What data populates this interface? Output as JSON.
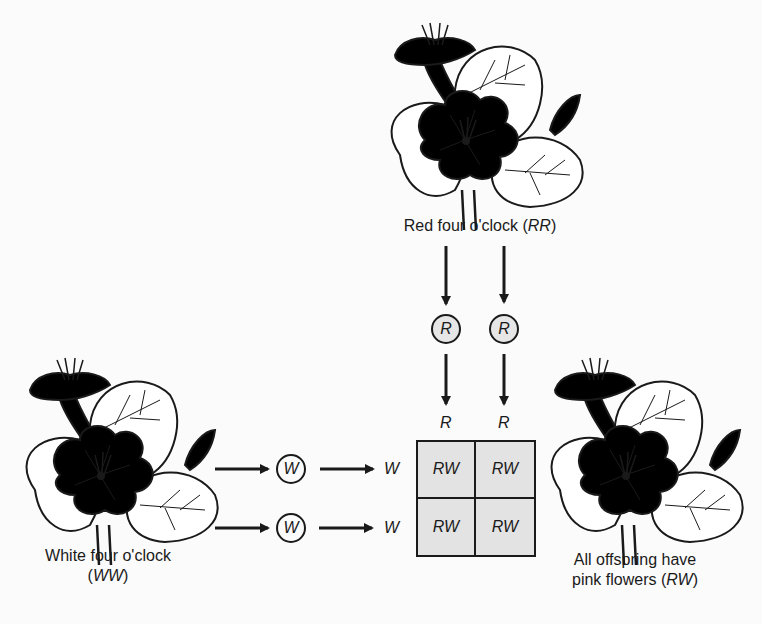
{
  "diagram": {
    "type": "punnett-square-incomplete-dominance",
    "colors": {
      "line": "#1a1a1a",
      "red_fill": "#9a9a9a",
      "pink_fill": "#b8b8b8",
      "grid_fill": "#e3e3e3",
      "background": "#fbfbfb"
    },
    "parents": {
      "red": {
        "label_prefix": "Red four o'clock (",
        "genotype": "RR",
        "label_suffix": ")"
      },
      "white": {
        "label_line1": "White four o'clock",
        "label_prefix": "(",
        "genotype": "WW",
        "label_suffix": ")"
      }
    },
    "offspring": {
      "label_line1": "All offspring have",
      "label_prefix": "pink flowers (",
      "genotype": "RW",
      "label_suffix": ")"
    },
    "gametes": {
      "red": [
        "R",
        "R"
      ],
      "white": [
        "W",
        "W"
      ]
    },
    "punnett": {
      "column_headers": [
        "R",
        "R"
      ],
      "row_headers": [
        "W",
        "W"
      ],
      "cells": [
        [
          "RW",
          "RW"
        ],
        [
          "RW",
          "RW"
        ]
      ]
    }
  }
}
